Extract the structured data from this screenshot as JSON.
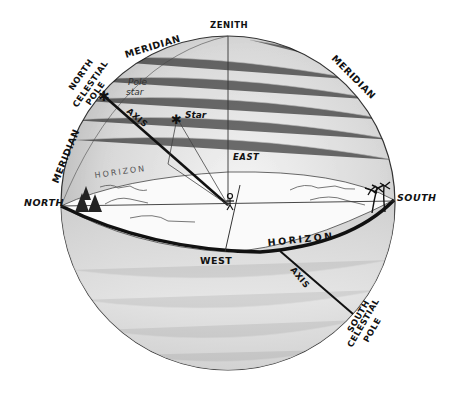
{
  "labels": {
    "zenith": "ZENITH",
    "meridian_left_top": "MERIDIAN",
    "meridian_right": "MERIDIAN",
    "meridian_left_side": "MERIDIAN",
    "north_celestial_pole": [
      "NORTH",
      "CELESTIAL",
      "POLE"
    ],
    "pole_star": [
      "Pole",
      "star"
    ],
    "axis_upper": "AXIS",
    "axis_lower": "AXIS",
    "star": "Star",
    "horizon_back": "HORIZON",
    "horizon_front": "HORIZON",
    "east": "EAST",
    "west": "WEST",
    "north": "NORTH",
    "south": "SOUTH",
    "south_celestial_pole": [
      "SOUTH",
      "CELESTIAL",
      "POLE"
    ]
  },
  "colors": {
    "line": "#1a1a1a",
    "sphere_shade": "#c9c9c9",
    "sphere_light": "#f2f2f2",
    "horizon_plane": "#fafafa"
  }
}
